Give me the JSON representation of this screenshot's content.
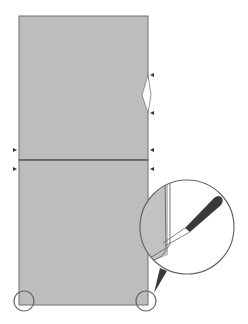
{
  "diagram": {
    "colors": {
      "panel_fill": "#bdbdbd",
      "panel_stroke": "#6e6e6e",
      "marker": "#333333",
      "highlight_circle": "#666666",
      "tool_handle": "#3a3a3a",
      "background": "#ffffff"
    },
    "panels": [
      {
        "name": "upper-panel"
      },
      {
        "name": "lower-panel"
      }
    ],
    "markers": [
      {
        "name": "marker-right-upper-notch-top",
        "side": "right"
      },
      {
        "name": "marker-right-upper-notch-bottom",
        "side": "right"
      },
      {
        "name": "marker-left-seam-above",
        "side": "left"
      },
      {
        "name": "marker-right-seam-above",
        "side": "right"
      },
      {
        "name": "marker-left-seam-below",
        "side": "left"
      },
      {
        "name": "marker-right-seam-below",
        "side": "right"
      }
    ],
    "highlights": [
      {
        "name": "corner-circle-bottom-left"
      },
      {
        "name": "corner-circle-bottom-right"
      }
    ],
    "inset": {
      "name": "magnified-inset",
      "tool": "chisel-icon"
    }
  }
}
